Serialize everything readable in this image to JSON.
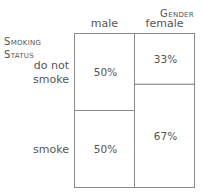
{
  "chart_data": {
    "type": "mosaic",
    "title": "",
    "column_variable": "Gender",
    "row_variable": "Smoking Status",
    "row_variable_lines": [
      "Smoking",
      "Status"
    ],
    "categories": [
      "male",
      "female"
    ],
    "column_widths": [
      0.5,
      0.5
    ],
    "rows": [
      {
        "name": "do not smoke",
        "label_lines": [
          "do not",
          "smoke"
        ]
      },
      {
        "name": "smoke",
        "label_lines": [
          "smoke"
        ]
      }
    ],
    "series": [
      {
        "name": "do not smoke",
        "values": [
          0.5,
          0.33
        ]
      },
      {
        "name": "smoke",
        "values": [
          0.5,
          0.67
        ]
      }
    ],
    "cell_labels": [
      [
        "50%",
        "33%"
      ],
      [
        "50%",
        "67%"
      ]
    ],
    "row_label_reference_column": 0
  },
  "colors": {
    "border": "#8a8a8a",
    "text": "#555555",
    "fill": "#ffffff"
  }
}
